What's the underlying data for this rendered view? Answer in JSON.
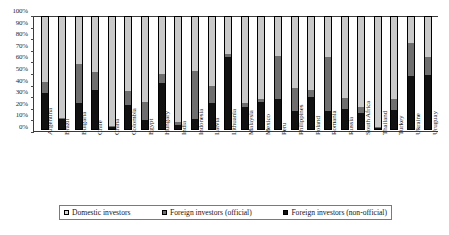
{
  "chart_data": {
    "type": "bar",
    "stacked": true,
    "normalized_percent": true,
    "title": "",
    "subtitle": "",
    "xlabel": "",
    "ylabel": "",
    "ylim": [
      0,
      100
    ],
    "ytick_labels": [
      "100%",
      "90%",
      "80%",
      "70%",
      "60%",
      "50%",
      "40%",
      "30%",
      "20%",
      "10%",
      "0%"
    ],
    "ytick_values": [
      100,
      90,
      80,
      70,
      60,
      50,
      40,
      30,
      20,
      10,
      0
    ],
    "grid": false,
    "legend_position": "bottom",
    "categories": [
      "Argentina",
      "Brazil",
      "Bulgaria",
      "Chile",
      "China",
      "Colombia",
      "Egypt",
      "Hungary",
      "India",
      "Indonesia",
      "Latvia",
      "Lithuania",
      "Malaysia",
      "Mexico",
      "Peru",
      "Philippines",
      "Poland",
      "Romania",
      "Russia",
      "South Africa",
      "Thailand",
      "Turkey",
      "Ukraine",
      "Uruguay"
    ],
    "series": [
      {
        "name": "Foreign investors (non-official)",
        "color": "#111111",
        "stack_order": 0,
        "values": [
          32,
          9,
          23,
          35,
          2,
          21,
          8,
          41,
          4,
          9,
          23,
          64,
          20,
          24,
          27,
          16,
          29,
          16,
          18,
          14,
          1,
          17,
          47,
          48
        ]
      },
      {
        "name": "Foreign investors (official)",
        "color": "#6e6e6e",
        "stack_order": 1,
        "values": [
          10,
          1,
          35,
          16,
          1,
          13,
          16,
          8,
          2,
          43,
          15,
          3,
          3,
          3,
          38,
          21,
          6,
          48,
          10,
          6,
          1,
          10,
          30,
          16
        ]
      },
      {
        "name": "Domestic investors",
        "color": "#c9c9c9",
        "stack_order": 2,
        "values": [
          58,
          90,
          42,
          49,
          97,
          66,
          76,
          51,
          94,
          48,
          62,
          33,
          77,
          73,
          35,
          63,
          65,
          36,
          72,
          80,
          98,
          73,
          23,
          36
        ]
      }
    ],
    "cumulative_tops": {
      "nonofficial": [
        32,
        9,
        23,
        35,
        2,
        21,
        8,
        41,
        4,
        9,
        23,
        64,
        20,
        24,
        27,
        16,
        29,
        16,
        18,
        14,
        1,
        17,
        47,
        48
      ],
      "official": [
        42,
        10,
        58,
        51,
        3,
        34,
        24,
        49,
        6,
        52,
        38,
        67,
        23,
        27,
        65,
        37,
        35,
        64,
        28,
        20,
        2,
        27,
        77,
        64
      ],
      "domestic": [
        100,
        100,
        100,
        100,
        100,
        100,
        100,
        100,
        100,
        100,
        100,
        100,
        100,
        100,
        100,
        100,
        100,
        100,
        100,
        100,
        100,
        100,
        100,
        100
      ]
    }
  },
  "legend": {
    "items": [
      {
        "label": "Domestic investors",
        "swatch": "domestic"
      },
      {
        "label": "Foreign investors (official)",
        "swatch": "official"
      },
      {
        "label": "Foreign investors (non-official)",
        "swatch": "nonofficial"
      }
    ]
  }
}
